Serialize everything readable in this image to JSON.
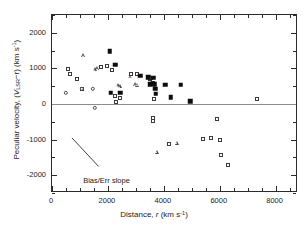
{
  "chart_data": {
    "type": "scatter",
    "title": "",
    "xlabel": "Distance, r (km s⁻¹)",
    "ylabel": "Peculiar velocity, (V_LSR − r) (km s⁻¹)",
    "xlim": [
      0,
      8800
    ],
    "ylim": [
      -2500,
      2500
    ],
    "xticks": [
      0,
      2000,
      4000,
      6000,
      8000
    ],
    "xtick_labels": [
      "0",
      "2000",
      "4000",
      "6000",
      "8000"
    ],
    "xminor_interval": 500,
    "yticks": [
      2000,
      1000,
      0,
      -1000,
      -2000
    ],
    "ytick_labels": [
      "2000",
      "1000",
      "0",
      "-1000",
      "-2000"
    ],
    "yminor_interval": 500,
    "grid": false,
    "legend": null,
    "reference_line": {
      "y": 0,
      "style": "solid",
      "color": "#8d8d8d"
    },
    "annotations": [
      {
        "text": "Bias/Err slope",
        "x": 1150,
        "y": -2050
      },
      {
        "line": {
          "x1": 750,
          "y1": -980,
          "x2": 1700,
          "y2": -1780
        }
      }
    ],
    "series": [
      {
        "name": "open-square",
        "marker": "square-open",
        "points": [
          [
            570,
            990
          ],
          [
            640,
            845
          ],
          [
            900,
            690
          ],
          [
            1080,
            420
          ],
          [
            1760,
            1030
          ],
          [
            1960,
            1060
          ],
          [
            2130,
            965
          ],
          [
            2250,
            230
          ],
          [
            2290,
            55
          ],
          [
            2430,
            155
          ],
          [
            2840,
            845
          ],
          [
            3050,
            835
          ],
          [
            3490,
            700
          ],
          [
            3540,
            735
          ],
          [
            3600,
            590
          ],
          [
            3640,
            150
          ],
          [
            3620,
            -390
          ],
          [
            3620,
            -470
          ],
          [
            4200,
            -1130
          ],
          [
            5400,
            -980
          ],
          [
            5700,
            -960
          ],
          [
            5900,
            -435
          ],
          [
            6000,
            -1000
          ],
          [
            6050,
            -1420
          ],
          [
            6300,
            -1700
          ],
          [
            7350,
            140
          ]
        ]
      },
      {
        "name": "open-triangle",
        "marker": "triangle-open",
        "points": [
          [
            1120,
            1365
          ],
          [
            1540,
            985
          ],
          [
            1620,
            1005
          ],
          [
            2350,
            520
          ],
          [
            2420,
            505
          ],
          [
            2980,
            560
          ],
          [
            3050,
            545
          ],
          [
            3750,
            -1340
          ],
          [
            4460,
            -1090
          ]
        ]
      },
      {
        "name": "filled-square",
        "marker": "square-filled",
        "points": [
          [
            2070,
            1480
          ],
          [
            2260,
            1100
          ],
          [
            2100,
            320
          ],
          [
            2450,
            320
          ],
          [
            3150,
            790
          ],
          [
            3450,
            755
          ],
          [
            3510,
            560
          ],
          [
            3560,
            575
          ],
          [
            3620,
            740
          ],
          [
            3680,
            560
          ],
          [
            3700,
            430
          ],
          [
            3720,
            290
          ],
          [
            4050,
            545
          ],
          [
            4240,
            195
          ],
          [
            4600,
            540
          ],
          [
            4950,
            80
          ]
        ]
      },
      {
        "name": "open-circle",
        "marker": "circle-open",
        "points": [
          [
            490,
            310
          ],
          [
            1070,
            430
          ],
          [
            1470,
            420
          ],
          [
            1530,
            -110
          ]
        ]
      },
      {
        "name": "cross",
        "marker": "x",
        "points": [
          [
            2790,
            800
          ]
        ]
      }
    ]
  },
  "axis_titles": {
    "x_prefix": "Distance, ",
    "x_italic": "r",
    "x_unit": " (km s",
    "x_exp": "-1",
    "x_close": ")",
    "y_prefix": "Peculiar velocity, (",
    "y_italic": "V",
    "y_sub": "LSR",
    "y_mid": "−r) (km s",
    "y_exp": "-1",
    "y_close": ")"
  },
  "annotation": {
    "label": "Bias/Err slope"
  }
}
